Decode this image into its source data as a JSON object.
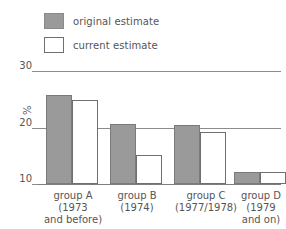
{
  "chart_data": {
    "type": "bar",
    "title": "",
    "subtitle": "",
    "xlabel": "",
    "ylabel": "%",
    "ylim": [
      10,
      30
    ],
    "yticks": [
      10,
      20,
      30
    ],
    "ytick_labels": [
      "10",
      "20",
      "30"
    ],
    "grid": true,
    "legend_position": "top-left",
    "categories": [
      "group A (1973 and before)",
      "group B (1974)",
      "group C (1977/1978)",
      "group D (1979 and on)"
    ],
    "category_lines": [
      [
        "group A",
        "(1973",
        "and before)"
      ],
      [
        "group B",
        "(1974)",
        ""
      ],
      [
        "group C",
        "(1977/1978)",
        ""
      ],
      [
        "group D",
        "(1979",
        "and on)"
      ]
    ],
    "series": [
      {
        "name": "original estimate",
        "color": "#9a9a9a",
        "values": [
          25.8,
          20.6,
          20.4,
          12.1
        ]
      },
      {
        "name": "current estimate",
        "color": "#ffffff",
        "values": [
          24.9,
          15.1,
          19.2,
          12.1
        ]
      }
    ]
  },
  "legend": {
    "items": [
      {
        "label": "original estimate",
        "swatch": "filled"
      },
      {
        "label": "current estimate",
        "swatch": "hollow"
      }
    ]
  },
  "axis": {
    "y_label": "%",
    "y_ticks": [
      "30",
      "20",
      "10"
    ]
  },
  "colors": {
    "bar_fill": "#9a9a9a",
    "bar_stroke": "#7a7a7a",
    "hollow_stroke": "#6f6f6f",
    "axis": "#8c8c8c",
    "text": "#555555",
    "background": "#ffffff"
  }
}
